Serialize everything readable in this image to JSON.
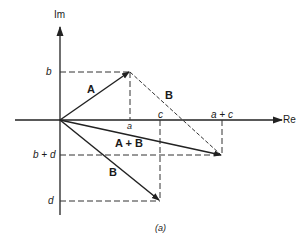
{
  "diagram": {
    "axes": {
      "x_label": "Re",
      "y_label": "Im"
    },
    "vectors": [
      {
        "name": "A",
        "label": "A",
        "from": [
          0,
          0
        ],
        "to": [
          "a",
          "b"
        ]
      },
      {
        "name": "B",
        "label": "B",
        "from": [
          0,
          0
        ],
        "to": [
          "c",
          "d"
        ]
      },
      {
        "name": "B-translated",
        "label": "B",
        "from": [
          "a",
          "b"
        ],
        "to": [
          "a+c",
          "b+d"
        ],
        "style": "dashed"
      },
      {
        "name": "A+B",
        "label": "A + B",
        "from": [
          0,
          0
        ],
        "to": [
          "a+c",
          "b+d"
        ]
      }
    ],
    "x_ticks": {
      "a": "a",
      "c": "c",
      "a_plus_c": "a + c"
    },
    "y_ticks": {
      "b": "b",
      "b_plus_d": "b + d",
      "d": "d"
    },
    "caption": "(a)",
    "colors": {
      "line": "#222222",
      "background": "#ffffff"
    }
  }
}
